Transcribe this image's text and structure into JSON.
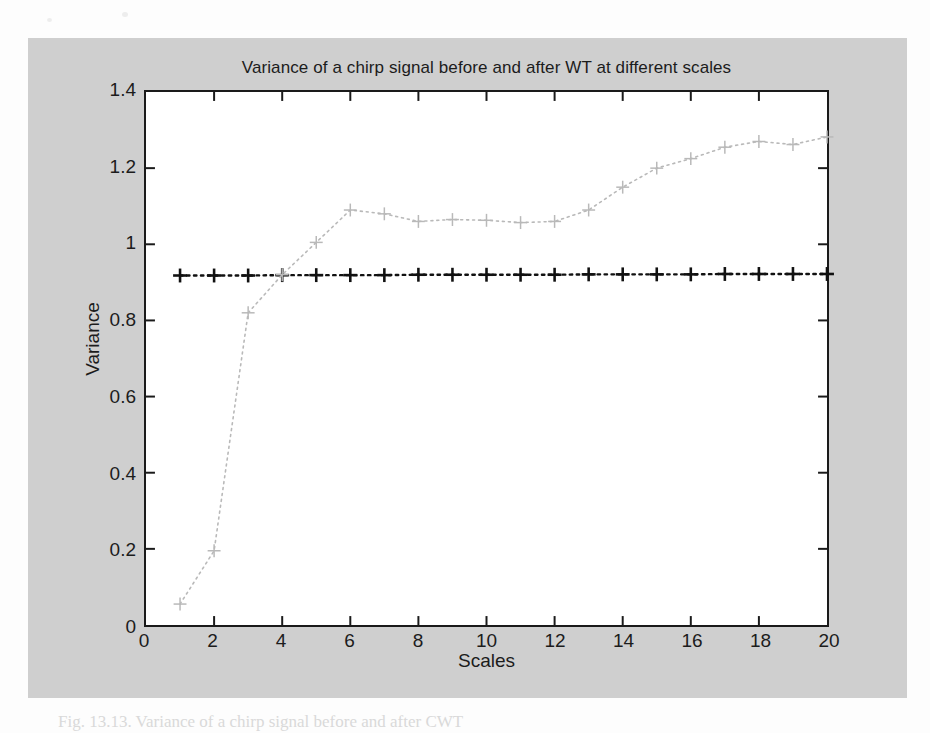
{
  "figure": {
    "background_color": "#cfcfcf",
    "axes_background_color": "#ffffff",
    "axes_border_color": "#1a1a1a"
  },
  "caption": "Fig. 13.13. Variance of a chirp signal before and after CWT",
  "chart_data": {
    "type": "line",
    "title": "Variance of a chirp signal before and after WT at different scales",
    "xlabel": "Scales",
    "ylabel": "Variance",
    "xlim": [
      0,
      20
    ],
    "ylim": [
      0,
      1.4
    ],
    "xticks": [
      0,
      2,
      4,
      6,
      8,
      10,
      12,
      14,
      16,
      18,
      20
    ],
    "xtick_labels": [
      "0",
      "2",
      "4",
      "6",
      "8",
      "10",
      "12",
      "14",
      "16",
      "18",
      "20"
    ],
    "yticks": [
      0,
      0.2,
      0.4,
      0.6,
      0.8,
      1,
      1.2,
      1.4
    ],
    "ytick_labels": [
      "0",
      "0.2",
      "0.4",
      "0.6",
      "0.8",
      "1",
      "1.2",
      "1.4"
    ],
    "grid": false,
    "legend": null,
    "x": [
      1,
      2,
      3,
      4,
      5,
      6,
      7,
      8,
      9,
      10,
      11,
      12,
      13,
      14,
      15,
      16,
      17,
      18,
      19,
      20
    ],
    "series": [
      {
        "name": "Variance before WT",
        "marker": "+",
        "linestyle": "dotted",
        "color": "#111111",
        "values": [
          0.918,
          0.918,
          0.918,
          0.919,
          0.919,
          0.919,
          0.919,
          0.92,
          0.92,
          0.92,
          0.92,
          0.92,
          0.921,
          0.921,
          0.921,
          0.921,
          0.922,
          0.922,
          0.922,
          0.922
        ]
      },
      {
        "name": "Variance after WT",
        "marker": "+",
        "linestyle": "dotted",
        "color": "#b9b9b9",
        "values": [
          0.055,
          0.195,
          0.82,
          0.92,
          1.005,
          1.09,
          1.08,
          1.06,
          1.065,
          1.063,
          1.057,
          1.06,
          1.09,
          1.15,
          1.2,
          1.225,
          1.255,
          1.27,
          1.262,
          1.282
        ]
      }
    ]
  }
}
